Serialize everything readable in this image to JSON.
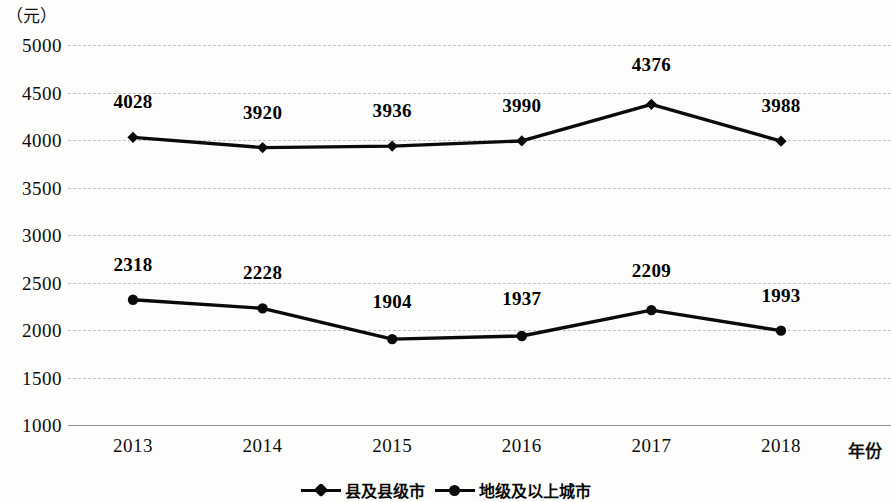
{
  "axis": {
    "y_unit_caption": "（元）",
    "x_axis_title": "年份",
    "y_ticks": [
      "5000",
      "4500",
      "4000",
      "3500",
      "3000",
      "2500",
      "2000",
      "1500",
      "1000"
    ],
    "x_ticks": [
      "2013",
      "2014",
      "2015",
      "2016",
      "2017",
      "2018"
    ]
  },
  "legend": {
    "items": [
      {
        "label": "县及县级市",
        "marker": "diamond-marker",
        "color": "#0a0a0a"
      },
      {
        "label": "地级及以上城市",
        "marker": "circle-marker",
        "color": "#0a0a0a"
      }
    ]
  },
  "chart_data": {
    "type": "line",
    "title": "",
    "subtitle": "",
    "xlabel": "年份",
    "ylabel": "（元）",
    "categories": [
      "2013",
      "2014",
      "2015",
      "2016",
      "2017",
      "2018"
    ],
    "ylim": [
      1000,
      5000
    ],
    "ytick_step": 500,
    "grid": true,
    "legend_position": "bottom-center",
    "series": [
      {
        "name": "县及县级市",
        "marker": "diamond",
        "color": "#0a0a0a",
        "values": [
          4028,
          3920,
          3936,
          3990,
          4376,
          3988
        ],
        "data_labels": [
          "4028",
          "3920",
          "3936",
          "3990",
          "4376",
          "3988"
        ]
      },
      {
        "name": "地级及以上城市",
        "marker": "circle",
        "color": "#0a0a0a",
        "values": [
          2318,
          2228,
          1904,
          1937,
          2209,
          1993
        ],
        "data_labels": [
          "2318",
          "2228",
          "1904",
          "1937",
          "2209",
          "1993"
        ]
      }
    ]
  }
}
